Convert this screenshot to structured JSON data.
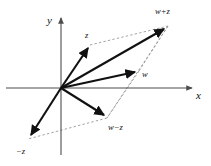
{
  "figure": {
    "background_color": "#ffffff",
    "axis_color": "#4d4d4d",
    "vector_color": "#111111",
    "guide_color": "#8c8c8c",
    "width": 211,
    "height": 166
  },
  "axes": {
    "x_label": "x",
    "y_label": "y",
    "origin": {
      "x": 61,
      "y": 88
    },
    "x_axis": {
      "x1": 6,
      "y1": 88,
      "x2": 196,
      "y2": 88
    },
    "y_axis": {
      "x1": 61,
      "y1": 155,
      "x2": 61,
      "y2": 14
    }
  },
  "vectors": [
    {
      "id": "vector-z",
      "label": "z",
      "from": {
        "x": 61,
        "y": 88
      },
      "to": {
        "x": 90,
        "y": 45
      },
      "label_pos": {
        "x": 85,
        "y": 38
      }
    },
    {
      "id": "vector-w",
      "label": "w",
      "from": {
        "x": 61,
        "y": 88
      },
      "to": {
        "x": 139,
        "y": 71
      },
      "label_pos": {
        "x": 142,
        "y": 77
      }
    },
    {
      "id": "vector-w-plus-z",
      "label": "w+z",
      "from": {
        "x": 61,
        "y": 88
      },
      "to": {
        "x": 168,
        "y": 26
      },
      "label_pos": {
        "x": 158,
        "y": 14
      }
    },
    {
      "id": "vector-w-minus-z",
      "label": "w−z",
      "from": {
        "x": 61,
        "y": 88
      },
      "to": {
        "x": 107,
        "y": 118
      },
      "label_pos": {
        "x": 110,
        "y": 129
      }
    },
    {
      "id": "vector-minus-z",
      "label": "−z",
      "from": {
        "x": 61,
        "y": 88
      },
      "to": {
        "x": 28,
        "y": 139
      },
      "label_pos": {
        "x": 17,
        "y": 153
      }
    }
  ],
  "guides": [
    {
      "id": "guide-z-to-wplusz",
      "x1": 90,
      "y1": 45,
      "x2": 168,
      "y2": 26
    },
    {
      "id": "guide-w-to-wplusz",
      "x1": 139,
      "y1": 71,
      "x2": 168,
      "y2": 26
    },
    {
      "id": "guide-wplusz-to-wminusz",
      "x1": 168,
      "y1": 26,
      "x2": 107,
      "y2": 118
    },
    {
      "id": "guide-wminusz-to-minusz",
      "x1": 107,
      "y1": 118,
      "x2": 28,
      "y2": 139
    },
    {
      "id": "guide-w-to-wminusz",
      "x1": 139,
      "y1": 71,
      "x2": 107,
      "y2": 118
    }
  ]
}
